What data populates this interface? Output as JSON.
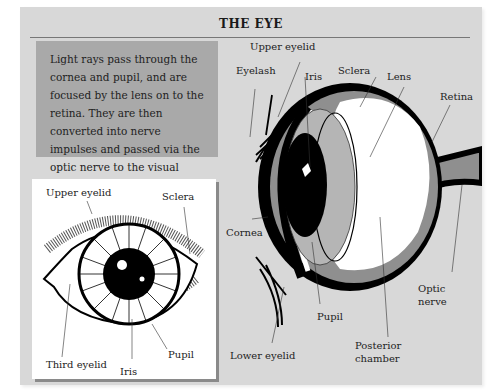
{
  "title": "THE EYE",
  "description": "Light rays pass through the cornea and pupil, and are focused by the lens on to the retina. They are then converted into nerve impulses and passed via the optic nerve to the visual cortex of the brain.",
  "front_view": {
    "labels": {
      "upper_eyelid": "Upper eyelid",
      "sclera": "Sclera",
      "third_eyelid": "Third eyelid",
      "iris": "Iris",
      "pupil": "Pupil"
    }
  },
  "cross_section": {
    "labels": {
      "upper_eyelid": "Upper eyelid",
      "eyelash": "Eyelash",
      "iris": "Iris",
      "sclera": "Sclera",
      "lens": "Lens",
      "retina": "Retina",
      "cornea": "Cornea",
      "pupil": "Pupil",
      "optic_nerve_1": "Optic",
      "optic_nerve_2": "nerve",
      "lower_eyelid": "Lower eyelid",
      "posterior_chamber_1": "Posterior",
      "posterior_chamber_2": "chamber"
    }
  },
  "colors": {
    "panel": "#d8d8d8",
    "textbox": "#a9a9a9",
    "inset": "#ffffff",
    "retina_layer": "#8f8f8f",
    "iris_gray": "#b5b5b5"
  }
}
